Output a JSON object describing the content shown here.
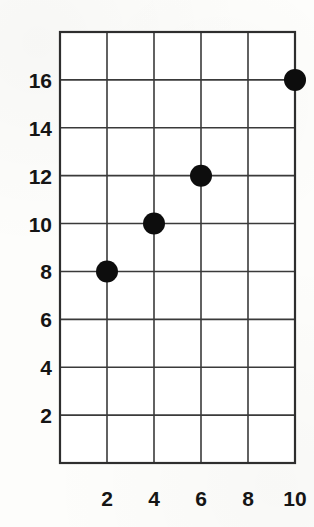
{
  "figure": {
    "background_color": "#fdfdfb",
    "ink_color": "#151515",
    "grid_color": "#3a3a3a",
    "marker_color": "#0d0d0d"
  },
  "chart_data": {
    "type": "scatter",
    "title": "",
    "subtitle": "",
    "xlabel": "",
    "ylabel": "",
    "x": [
      2,
      4,
      6,
      10
    ],
    "y": [
      8,
      10,
      12,
      16
    ],
    "points": [
      {
        "x": 2,
        "y": 8
      },
      {
        "x": 4,
        "y": 10
      },
      {
        "x": 6,
        "y": 12
      },
      {
        "x": 10,
        "y": 16
      }
    ],
    "xlim": [
      0,
      10
    ],
    "ylim": [
      0,
      18
    ],
    "xticks": [
      2,
      4,
      6,
      8,
      10
    ],
    "yticks": [
      2,
      4,
      6,
      8,
      10,
      12,
      14,
      16
    ],
    "xtick_labels": [
      "2",
      "4",
      "6",
      "8",
      "10"
    ],
    "ytick_labels": [
      "2",
      "4",
      "6",
      "8",
      "10",
      "12",
      "14",
      "16"
    ],
    "grid": true,
    "legend": null,
    "annotations": [],
    "marker": "filled-circle",
    "marker_size": 22
  },
  "axes": {
    "y_labels": [
      {
        "value": 16,
        "text": "16"
      },
      {
        "value": 14,
        "text": "14"
      },
      {
        "value": 12,
        "text": "12"
      },
      {
        "value": 10,
        "text": "10"
      },
      {
        "value": 8,
        "text": "8"
      },
      {
        "value": 6,
        "text": "6"
      },
      {
        "value": 4,
        "text": "4"
      },
      {
        "value": 2,
        "text": "2"
      }
    ],
    "x_labels": [
      {
        "value": 2,
        "text": "2"
      },
      {
        "value": 4,
        "text": "4"
      },
      {
        "value": 6,
        "text": "6"
      },
      {
        "value": 8,
        "text": "8"
      },
      {
        "value": 10,
        "text": "10"
      }
    ]
  }
}
